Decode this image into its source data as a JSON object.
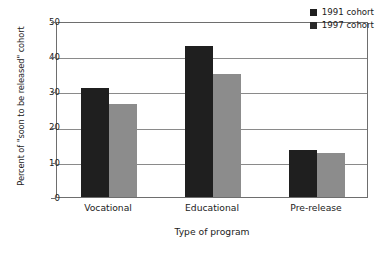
{
  "chart_data": {
    "type": "bar",
    "title": "",
    "categories": [
      "Vocational",
      "Educational",
      "Pre-release"
    ],
    "series": [
      {
        "name": "1991 cohort",
        "color": "#1f1f1f",
        "values": [
          31,
          43,
          13.3
        ]
      },
      {
        "name": "1997 cohort",
        "color": "#8c8c8c",
        "values": [
          26.5,
          35,
          12.6
        ]
      }
    ],
    "xlabel": "Type of program",
    "ylabel": "Percent of \"soon to be released\" cohort",
    "ylim": [
      0,
      50
    ],
    "ytick_step": 10,
    "yticks": [
      "50",
      "40",
      "30",
      "20",
      "10",
      "0"
    ],
    "grid": true,
    "legend_position": "top-right"
  },
  "legend": {
    "entries": [
      {
        "label": "1991 cohort"
      },
      {
        "label": "1997 cohort"
      }
    ]
  },
  "colors": {
    "series_1991": "#1f1f1f",
    "series_1997": "#8c8c8c",
    "axis": "#6e6e6e",
    "grid": "#8a8a8a",
    "background": "#ffffff"
  }
}
